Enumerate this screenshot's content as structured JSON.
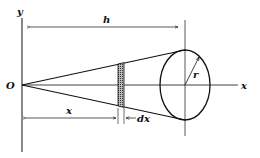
{
  "diagram": {
    "labels": {
      "y_axis": "y",
      "x_axis": "x",
      "origin": "O",
      "height": "h",
      "radius": "r",
      "position": "x",
      "slice_width": "dx"
    },
    "colors": {
      "stroke": "#111111",
      "background": "#ffffff",
      "hatch": "#444444"
    }
  }
}
